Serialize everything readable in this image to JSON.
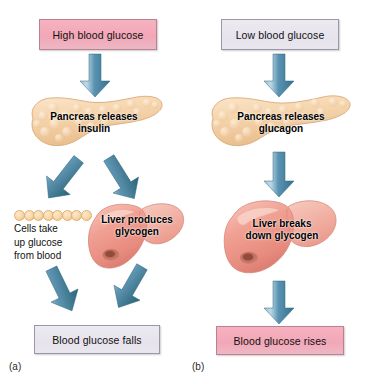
{
  "figure": {
    "background_color": "#ffffff",
    "arrow_color": "#3f7d9c",
    "arrow_color_light": "#a9cada",
    "pink_box_color": "#f2a7b7",
    "lilac_box_color": "#e8e5ee",
    "pancreas_color": "#f2d2a8",
    "liver_color": "#ef9e92",
    "cell_color": "#f8d7a8"
  },
  "panels": [
    {
      "id": "a",
      "caption": "(a)",
      "start_box": {
        "label": "High blood glucose",
        "style": "pink"
      },
      "organ_pancreas": {
        "name": "pancreas",
        "label_line1": "Pancreas releases",
        "label_line2": "insulin"
      },
      "branch_left": {
        "name": "cells-take-up-glucose",
        "label_line1": "Cells take",
        "label_line2": "up glucose",
        "label_line3": "from blood",
        "cell_count": 8
      },
      "branch_right": {
        "name": "liver",
        "label_line1": "Liver produces",
        "label_line2": "glycogen"
      },
      "end_box": {
        "label": "Blood glucose falls",
        "style": "lilac"
      }
    },
    {
      "id": "b",
      "caption": "(b)",
      "start_box": {
        "label": "Low blood glucose",
        "style": "lilac"
      },
      "organ_pancreas": {
        "name": "pancreas",
        "label_line1": "Pancreas releases",
        "label_line2": "glucagon"
      },
      "organ_liver": {
        "name": "liver",
        "label_line1": "Liver breaks",
        "label_line2": "down glycogen"
      },
      "end_box": {
        "label": "Blood glucose rises",
        "style": "pink"
      }
    }
  ]
}
